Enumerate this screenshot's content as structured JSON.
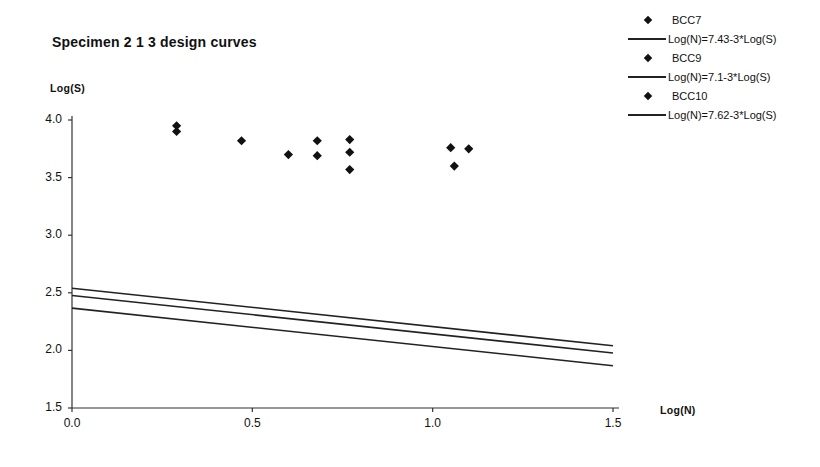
{
  "chart_data": {
    "type": "scatter",
    "title": "Specimen  2 1 3 design curves",
    "xlabel": "Log(N)",
    "ylabel": "Log(S)",
    "xlim": [
      0.0,
      1.5
    ],
    "ylim": [
      1.5,
      4.0
    ],
    "xticks": [
      "0.0",
      "0.5",
      "1.0",
      "1.5"
    ],
    "xtick_values": [
      0.0,
      0.5,
      1.0,
      1.5
    ],
    "yticks": [
      "1.5",
      "2.0",
      "2.5",
      "3.0",
      "3.5",
      "4.0"
    ],
    "ytick_values": [
      1.5,
      2.0,
      2.5,
      3.0,
      3.5,
      4.0
    ],
    "grid": false,
    "legend_position": "right",
    "series": [
      {
        "name": "BCC7",
        "type": "scatter",
        "marker": "diamond",
        "color": "#111111",
        "points": [
          {
            "x": 0.29,
            "y": 3.95
          },
          {
            "x": 0.29,
            "y": 3.9
          },
          {
            "x": 0.47,
            "y": 3.82
          },
          {
            "x": 0.6,
            "y": 3.7
          },
          {
            "x": 0.68,
            "y": 3.82
          },
          {
            "x": 0.68,
            "y": 3.69
          },
          {
            "x": 0.77,
            "y": 3.83
          },
          {
            "x": 0.77,
            "y": 3.72
          },
          {
            "x": 0.77,
            "y": 3.57
          },
          {
            "x": 1.05,
            "y": 3.76
          },
          {
            "x": 1.1,
            "y": 3.75
          },
          {
            "x": 1.06,
            "y": 3.6
          }
        ]
      },
      {
        "name": "Log(N)=7.43-3*Log(S)",
        "type": "line",
        "color": "#222222",
        "intercept": 7.43,
        "slope": -3,
        "endpoints": [
          {
            "x": 0.0,
            "y": 2.477
          },
          {
            "x": 1.5,
            "y": 1.977
          }
        ]
      },
      {
        "name": "BCC9",
        "type": "scatter",
        "marker": "diamond",
        "color": "#111111",
        "points": []
      },
      {
        "name": "Log(N)=7.1-3*Log(S)",
        "type": "line",
        "color": "#222222",
        "intercept": 7.1,
        "slope": -3,
        "endpoints": [
          {
            "x": 0.0,
            "y": 2.367
          },
          {
            "x": 1.5,
            "y": 1.867
          }
        ]
      },
      {
        "name": "BCC10",
        "type": "scatter",
        "marker": "diamond",
        "color": "#111111",
        "points": []
      },
      {
        "name": "Log(N)=7.62-3*Log(S)",
        "type": "line",
        "color": "#222222",
        "intercept": 7.62,
        "slope": -3,
        "endpoints": [
          {
            "x": 0.0,
            "y": 2.54
          },
          {
            "x": 1.5,
            "y": 2.04
          }
        ]
      }
    ]
  },
  "legend": {
    "entries": [
      {
        "label": "BCC7",
        "key": "marker"
      },
      {
        "label": "Log(N)=7.43-3*Log(S)",
        "key": "line"
      },
      {
        "label": "BCC9",
        "key": "marker"
      },
      {
        "label": "Log(N)=7.1-3*Log(S)",
        "key": "line"
      },
      {
        "label": "BCC10",
        "key": "marker"
      },
      {
        "label": "Log(N)=7.62-3*Log(S)",
        "key": "line"
      }
    ]
  },
  "colors": {
    "marker": "#111111",
    "line": "#222222",
    "axis": "#333333",
    "text": "#111111",
    "background": "#ffffff"
  }
}
